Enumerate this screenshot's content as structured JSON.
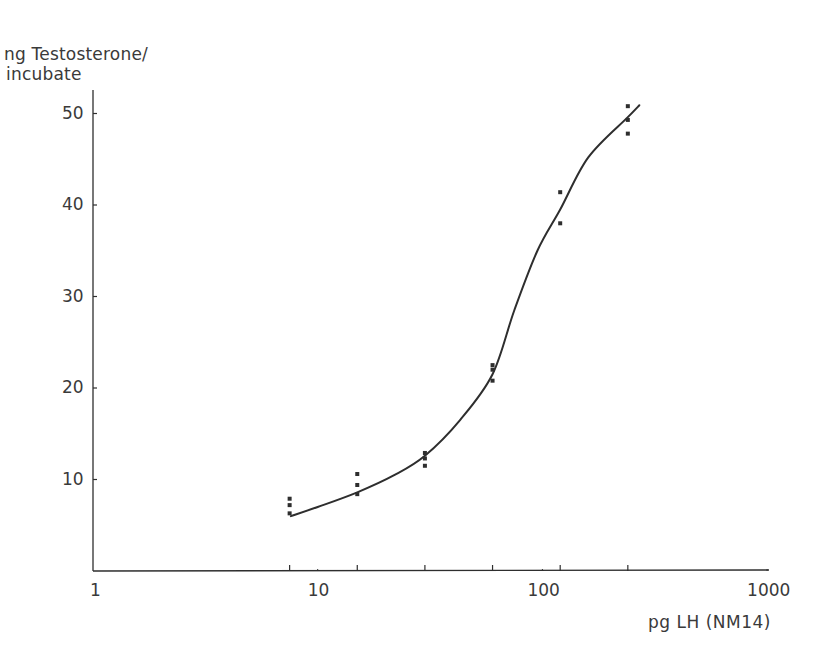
{
  "chart_data": {
    "type": "scatter",
    "subtype": "dose-response scatter with fitted sigmoid curve",
    "title": "",
    "ylabel": "ng Testosterone/ incubate",
    "ylabel_lines": [
      "ng Testosterone/",
      "incubate"
    ],
    "xlabel": "pg LH (NM14)",
    "xscale": "log",
    "xlim": [
      1,
      1000
    ],
    "ylim": [
      0,
      52
    ],
    "x_ticks": [
      1,
      10,
      100,
      1000
    ],
    "x_tick_labels": [
      "1",
      "10",
      "100",
      "1000"
    ],
    "y_ticks": [
      10,
      20,
      30,
      40,
      50
    ],
    "y_tick_labels": [
      "10",
      "20",
      "30",
      "40",
      "50"
    ],
    "x_minor_ticks_at_doses": [
      7.5,
      15,
      30,
      60,
      120,
      240
    ],
    "grid": false,
    "legend": null,
    "series": [
      {
        "name": "replicates",
        "kind": "points",
        "points": [
          {
            "x": 7.5,
            "y": 7.9
          },
          {
            "x": 7.5,
            "y": 7.2
          },
          {
            "x": 7.5,
            "y": 6.3
          },
          {
            "x": 15,
            "y": 10.6
          },
          {
            "x": 15,
            "y": 9.4
          },
          {
            "x": 15,
            "y": 8.4
          },
          {
            "x": 30,
            "y": 12.9
          },
          {
            "x": 30,
            "y": 12.3
          },
          {
            "x": 30,
            "y": 11.5
          },
          {
            "x": 60,
            "y": 22.5
          },
          {
            "x": 60,
            "y": 22.0
          },
          {
            "x": 60,
            "y": 20.8
          },
          {
            "x": 120,
            "y": 41.4
          },
          {
            "x": 120,
            "y": 38.0
          },
          {
            "x": 240,
            "y": 50.8
          },
          {
            "x": 240,
            "y": 49.3
          },
          {
            "x": 240,
            "y": 47.8
          }
        ]
      },
      {
        "name": "fitted curve",
        "kind": "line",
        "points": [
          {
            "x": 7.6,
            "y": 6.0
          },
          {
            "x": 10,
            "y": 7.0
          },
          {
            "x": 15,
            "y": 8.6
          },
          {
            "x": 22,
            "y": 10.5
          },
          {
            "x": 30,
            "y": 12.6
          },
          {
            "x": 43,
            "y": 16.5
          },
          {
            "x": 60,
            "y": 21.5
          },
          {
            "x": 75,
            "y": 28.5
          },
          {
            "x": 95,
            "y": 35.0
          },
          {
            "x": 120,
            "y": 39.5
          },
          {
            "x": 160,
            "y": 45.2
          },
          {
            "x": 240,
            "y": 49.6
          },
          {
            "x": 270,
            "y": 50.9
          }
        ]
      }
    ]
  }
}
